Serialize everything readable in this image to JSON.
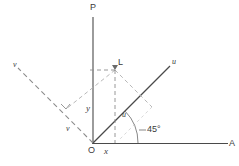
{
  "figure": {
    "type": "geometry-diagram",
    "colors": {
      "stroke": "#4a4a4a",
      "dashed_stroke": "#8c8c8c",
      "text": "#3a3a3a",
      "background": "#ffffff"
    },
    "geometry": {
      "origin": [
        93,
        143
      ],
      "point_L": [
        115,
        70
      ],
      "axis_angle_degrees": 45
    },
    "labels": {
      "axis_p": "P",
      "axis_a": "A",
      "origin": "O",
      "x_coordinate": "x",
      "y_coordinate": "y",
      "point_l": "L",
      "u_axis_end": "u",
      "u_component": "u",
      "v_axis_end": "v",
      "v_component": "v",
      "angle": "45°"
    }
  }
}
